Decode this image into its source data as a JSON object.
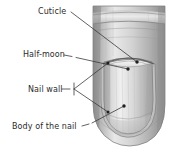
{
  "figure": {
    "background_color": "#ffffff",
    "label_color": "#2b2b2b",
    "leader_color": "#3a3a3a",
    "illustration_style": "grayscale-pencil-shading"
  },
  "labels": [
    {
      "id": "cuticle",
      "text": "Cuticle",
      "target_point": [
        137,
        62
      ]
    },
    {
      "id": "half-moon",
      "text": "Half-moon",
      "target_point": [
        128,
        69
      ]
    },
    {
      "id": "nail-wall",
      "text": "Nail wall",
      "target_point": [
        108,
        63
      ]
    },
    {
      "id": "body-of-the-nail",
      "text": "Body of the nail",
      "target_point": [
        124,
        106
      ]
    }
  ],
  "illustration": {
    "finger_outline_color": "#6e6e6e",
    "nail_plate_color": "#d9d9d9",
    "lunula_color": "#f2f2f2",
    "skin_shadow_color": "#9a9a9a",
    "skin_highlight_color": "#efefef"
  }
}
